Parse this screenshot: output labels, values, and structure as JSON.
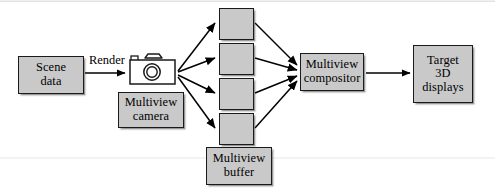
{
  "diagram": {
    "background_color": "#ffffff",
    "node_fill_color": "#c9c9c9",
    "node_border_color": "#1a1a1a",
    "arrow_color": "#000000",
    "nodes": [
      {
        "id": "scene-data",
        "name": "scene-data-box",
        "line1": "Scene",
        "line2": "data",
        "x": 18,
        "y": 56,
        "width": 66,
        "height": 38
      },
      {
        "id": "multiview-camera",
        "name": "multiview-camera-box",
        "line1": "Multiview",
        "line2": "camera",
        "x": 118,
        "y": 92,
        "width": 66,
        "height": 36
      },
      {
        "id": "multiview-buffer",
        "name": "multiview-buffer-box",
        "line1": "Multiview",
        "line2": "buffer",
        "x": 206,
        "y": 147,
        "width": 66,
        "height": 38
      },
      {
        "id": "multiview-compositor",
        "name": "multiview-compositor-box",
        "line1": "Multiview",
        "line2": "compositor",
        "x": 300,
        "y": 53,
        "width": 64,
        "height": 38
      },
      {
        "id": "target-3d-displays",
        "name": "target-3d-displays-box",
        "line1": "Target",
        "line2": "3D",
        "line3": "displays",
        "x": 413,
        "y": 45,
        "width": 60,
        "height": 58
      }
    ],
    "buffer_tiles": [
      {
        "id": "buffer-tile-1",
        "x": 219,
        "y": 8,
        "width": 35,
        "height": 32
      },
      {
        "id": "buffer-tile-2",
        "x": 219,
        "y": 43,
        "width": 35,
        "height": 32
      },
      {
        "id": "buffer-tile-3",
        "x": 219,
        "y": 78,
        "width": 35,
        "height": 32
      },
      {
        "id": "buffer-tile-4",
        "x": 219,
        "y": 113,
        "width": 35,
        "height": 32
      }
    ],
    "edge_labels": [
      {
        "id": "render-label",
        "name": "render-edge-label",
        "text": "Render",
        "x": 89,
        "y": 54
      }
    ],
    "icons": [
      {
        "id": "multiview-camera-icon",
        "name": "camera-icon",
        "x": 128,
        "y": 51,
        "width": 50,
        "height": 36
      }
    ],
    "connections": [
      {
        "from": "scene-data",
        "to": "multiview-camera-icon",
        "label": "Render"
      },
      {
        "from": "multiview-camera-icon",
        "to": "buffer-tile-1",
        "label": ""
      },
      {
        "from": "multiview-camera-icon",
        "to": "buffer-tile-2",
        "label": ""
      },
      {
        "from": "multiview-camera-icon",
        "to": "buffer-tile-3",
        "label": ""
      },
      {
        "from": "multiview-camera-icon",
        "to": "buffer-tile-4",
        "label": ""
      },
      {
        "from": "buffer-tile-1",
        "to": "multiview-compositor",
        "label": ""
      },
      {
        "from": "buffer-tile-2",
        "to": "multiview-compositor",
        "label": ""
      },
      {
        "from": "buffer-tile-3",
        "to": "multiview-compositor",
        "label": ""
      },
      {
        "from": "buffer-tile-4",
        "to": "multiview-compositor",
        "label": ""
      },
      {
        "from": "multiview-compositor",
        "to": "target-3d-displays",
        "label": ""
      }
    ]
  }
}
